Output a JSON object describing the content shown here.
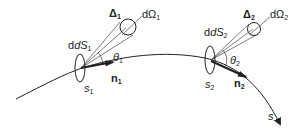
{
  "figure": {
    "curve_label": "s",
    "point1": {
      "direction_label": "Δ",
      "direction_sub": "1",
      "solid_angle_label": "dΩ",
      "solid_angle_sub": "1",
      "surface_label": "dS",
      "surface_sub": "1",
      "angle_label": "θ",
      "angle_sub": "1",
      "normal_label": "n",
      "normal_sub": "1",
      "point_label": "s",
      "point_sub": "1"
    },
    "point2": {
      "direction_label": "Δ",
      "direction_sub": "2",
      "solid_angle_label": "dΩ",
      "solid_angle_sub": "2",
      "surface_label": "dS",
      "surface_sub": "2",
      "angle_label": "θ",
      "angle_sub": "2",
      "normal_label": "n",
      "normal_sub": "2",
      "point_label": "s",
      "point_sub": "2"
    },
    "colors": {
      "stroke": "#222222",
      "background": "#ffffff"
    }
  }
}
